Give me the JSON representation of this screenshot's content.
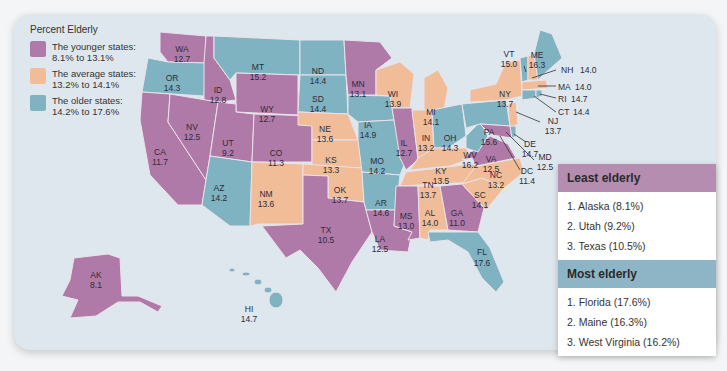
{
  "legend": {
    "title": "Percent Elderly",
    "items": [
      {
        "label": "The younger states:",
        "range": "8.1% to 13.1%",
        "color": "#b07aa8"
      },
      {
        "label": "The average states:",
        "range": "13.2% to 14.1%",
        "color": "#f0bd98"
      },
      {
        "label": "The older states:",
        "range": "14.2% to 17.6%",
        "color": "#7fb3c2"
      }
    ]
  },
  "states": [
    {
      "abbr": "WA",
      "value": "12.7"
    },
    {
      "abbr": "OR",
      "value": "14.3"
    },
    {
      "abbr": "CA",
      "value": "11.7"
    },
    {
      "abbr": "ID",
      "value": "12.8"
    },
    {
      "abbr": "NV",
      "value": "12.5"
    },
    {
      "abbr": "MT",
      "value": "15.2"
    },
    {
      "abbr": "WY",
      "value": "12.7"
    },
    {
      "abbr": "UT",
      "value": "9.2"
    },
    {
      "abbr": "CO",
      "value": "11.3"
    },
    {
      "abbr": "AZ",
      "value": "14.2"
    },
    {
      "abbr": "NM",
      "value": "13.6"
    },
    {
      "abbr": "ND",
      "value": "14.4"
    },
    {
      "abbr": "SD",
      "value": "14.4"
    },
    {
      "abbr": "NE",
      "value": "13.6"
    },
    {
      "abbr": "KS",
      "value": "13.3"
    },
    {
      "abbr": "OK",
      "value": "13.7"
    },
    {
      "abbr": "TX",
      "value": "10.5"
    },
    {
      "abbr": "MN",
      "value": "13.1"
    },
    {
      "abbr": "IA",
      "value": "14.9"
    },
    {
      "abbr": "MO",
      "value": "14.2"
    },
    {
      "abbr": "AR",
      "value": "14.6"
    },
    {
      "abbr": "LA",
      "value": "12.5"
    },
    {
      "abbr": "WI",
      "value": "13.9"
    },
    {
      "abbr": "IL",
      "value": "12.7"
    },
    {
      "abbr": "MI",
      "value": "14.1"
    },
    {
      "abbr": "IN",
      "value": "13.2"
    },
    {
      "abbr": "OH",
      "value": "14.3"
    },
    {
      "abbr": "KY",
      "value": "13.5"
    },
    {
      "abbr": "TN",
      "value": "13.7"
    },
    {
      "abbr": "MS",
      "value": "13.0"
    },
    {
      "abbr": "AL",
      "value": "14.0"
    },
    {
      "abbr": "GA",
      "value": "11.0"
    },
    {
      "abbr": "FL",
      "value": "17.6"
    },
    {
      "abbr": "SC",
      "value": "14.1"
    },
    {
      "abbr": "NC",
      "value": "13.2"
    },
    {
      "abbr": "VA",
      "value": "12.5"
    },
    {
      "abbr": "WV",
      "value": "16.2"
    },
    {
      "abbr": "PA",
      "value": "15.6"
    },
    {
      "abbr": "NY",
      "value": "13.7"
    },
    {
      "abbr": "VT",
      "value": "15.0"
    },
    {
      "abbr": "ME",
      "value": "16.3"
    },
    {
      "abbr": "NH",
      "value": "14.0"
    },
    {
      "abbr": "MA",
      "value": "14.0"
    },
    {
      "abbr": "RI",
      "value": "14.7"
    },
    {
      "abbr": "CT",
      "value": "14.4"
    },
    {
      "abbr": "NJ",
      "value": "13.7"
    },
    {
      "abbr": "DE",
      "value": "14.7"
    },
    {
      "abbr": "MD",
      "value": "12.5"
    },
    {
      "abbr": "DC",
      "value": "11.4"
    },
    {
      "abbr": "AK",
      "value": "8.1"
    },
    {
      "abbr": "HI",
      "value": "14.7"
    }
  ],
  "least_elderly": {
    "title": "Least elderly",
    "color": "#b07aa8",
    "items": [
      "1.  Alaska (8.1%)",
      "2.  Utah (9.2%)",
      "3.  Texas (10.5%)"
    ]
  },
  "most_elderly": {
    "title": "Most elderly",
    "color": "#7fb3c2",
    "items": [
      "1.  Florida (17.6%)",
      "2.  Maine (16.3%)",
      "3.  West Virginia (16.2%)"
    ]
  }
}
